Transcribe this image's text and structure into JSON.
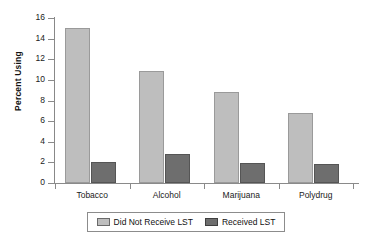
{
  "chart_data": {
    "type": "bar",
    "title": "",
    "subtitle": "",
    "xlabel": "",
    "ylabel": "Percent Using",
    "categories": [
      "Tobacco",
      "Alcohol",
      "Marijuana",
      "Polydrug"
    ],
    "series": [
      {
        "name": "Did Not Receive LST",
        "color": "#bebebe",
        "values": [
          15.0,
          10.9,
          8.8,
          6.75
        ]
      },
      {
        "name": "Received LST",
        "color": "#6e6e6e",
        "values": [
          2.0,
          2.85,
          1.9,
          1.8
        ]
      }
    ],
    "ylim": [
      0,
      16
    ],
    "ytick_step": 2,
    "yticks": [
      0,
      2,
      4,
      6,
      8,
      10,
      12,
      14,
      16
    ],
    "ytick_labels": [
      "0",
      "2",
      "4",
      "6",
      "8",
      "10",
      "12",
      "14",
      "16"
    ],
    "grid": false,
    "legend_position": "bottom",
    "legend_entries": [
      "Did Not Receive LST",
      "Received LST"
    ],
    "annotations": []
  },
  "colors": {
    "series_light": "#bebebe",
    "series_dark": "#6e6e6e",
    "axis": "#8a8a8a",
    "text": "#111111",
    "background": "#ffffff"
  }
}
